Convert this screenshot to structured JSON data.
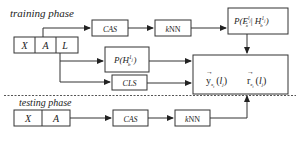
{
  "diagram": {
    "phases": {
      "training": "training phase",
      "testing": "testing phase"
    },
    "training_inputs": [
      "X",
      "A",
      "L"
    ],
    "testing_inputs": [
      "X",
      "A"
    ],
    "nodes": {
      "cas_train": "CAS",
      "knn_train": "kNN",
      "p_e_given_h": "P(E",
      "p_h": "P(H",
      "cls": "CLS",
      "cas_test": "CAS",
      "knn_test": "kNN",
      "output_y": "y",
      "output_r": "r"
    },
    "math": {
      "pe_sub": "x",
      "pe_sup": "l",
      "pe_sub_j": "j",
      "pe_sep": " | H",
      "ph_sub": "b",
      "ph_sup": "1",
      "ph_sup_j": "j",
      "close_paren": ")",
      "y_sub": "x",
      "y_sub2": "t",
      "r_sub": "x",
      "r_sub2": "t",
      "arg_open": "(",
      "arg_l": "l",
      "arg_sub": "j",
      "arg_close": ")",
      "vec_arrow": "→"
    },
    "edges": [
      {
        "from": "A",
        "to": "cas_train"
      },
      {
        "from": "cas_train",
        "to": "knn_train"
      },
      {
        "from": "knn_train",
        "to": "p_e_given_h"
      },
      {
        "from": "p_e_given_h",
        "to": "output"
      },
      {
        "from": "L",
        "to": "p_h"
      },
      {
        "from": "L",
        "to": "cls"
      },
      {
        "from": "p_h",
        "to": "output"
      },
      {
        "from": "cls",
        "to": "output"
      },
      {
        "from": "testing_inputs",
        "to": "cas_test"
      },
      {
        "from": "cas_test",
        "to": "knn_test"
      },
      {
        "from": "knn_test",
        "to": "output"
      }
    ]
  }
}
